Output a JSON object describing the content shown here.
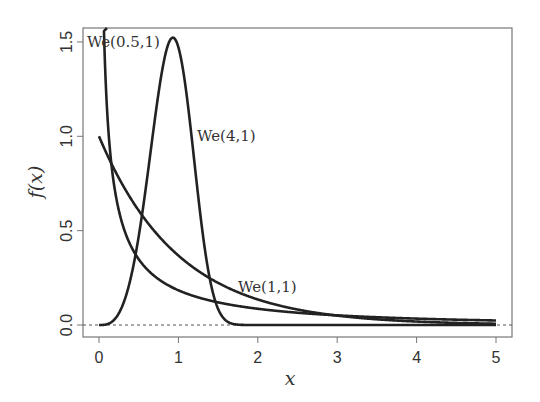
{
  "chart_data": {
    "type": "line",
    "title": "",
    "xlabel": "x",
    "ylabel": "f(x)",
    "xlim": [
      0,
      5
    ],
    "ylim": [
      0,
      1.55
    ],
    "x_ticks": [
      "0",
      "1",
      "2",
      "3",
      "4",
      "5"
    ],
    "y_ticks": [
      "0.0",
      "0.5",
      "1.0",
      "1.5"
    ],
    "grid": false,
    "legend": "inline labels",
    "reference_line": {
      "y": 0,
      "style": "dotted"
    },
    "series": [
      {
        "name": "We(0.5,1)",
        "shape": 0.5,
        "scale": 1,
        "label_pos": [
          0.05,
          1.5
        ]
      },
      {
        "name": "We(1,1)",
        "shape": 1,
        "scale": 1,
        "label_pos": [
          1.85,
          0.22
        ]
      },
      {
        "name": "We(4,1)",
        "shape": 4,
        "scale": 1,
        "label_pos": [
          1.25,
          1.0
        ]
      }
    ]
  },
  "labels": {
    "xlabel": "x",
    "ylabel": "f(x)",
    "s0": "We(0.5,1)",
    "s1": "We(1,1)",
    "s2": "We(4,1)"
  }
}
